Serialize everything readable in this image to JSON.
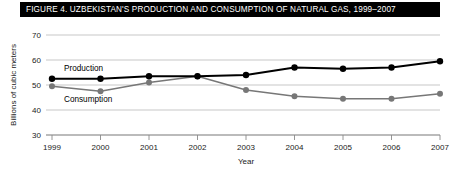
{
  "figure": {
    "title": "FIGURE 4. UZBEKISTAN'S PRODUCTION AND CONSUMPTION OF NATURAL GAS, 1999–2007"
  },
  "colors": {
    "title_bar_background": "#000000",
    "title_text": "#ffffff",
    "production_line": "#000000",
    "consumption_line": "#777777",
    "gridline": "#b9b9b9",
    "axis": "#8a8a8a",
    "page_background": "#ffffff"
  },
  "chart_data": {
    "type": "line",
    "title": "FIGURE 4. UZBEKISTAN'S PRODUCTION AND CONSUMPTION OF NATURAL GAS, 1999–2007",
    "xlabel": "Year",
    "ylabel": "Billions of cubic meters",
    "categories": [
      "1999",
      "2000",
      "2001",
      "2002",
      "2003",
      "2004",
      "2005",
      "2006",
      "2007"
    ],
    "x": [
      1999,
      2000,
      2001,
      2002,
      2003,
      2004,
      2005,
      2006,
      2007
    ],
    "ylim": [
      30,
      70
    ],
    "xlim": [
      1999,
      2007
    ],
    "yticks": [
      30,
      40,
      50,
      60,
      70
    ],
    "ytick_labels": [
      "30",
      "40",
      "50",
      "60",
      "70"
    ],
    "xticks": [
      1999,
      2000,
      2001,
      2002,
      2003,
      2004,
      2005,
      2006,
      2007
    ],
    "xtick_labels": [
      "1999",
      "2000",
      "2001",
      "2002",
      "2003",
      "2004",
      "2005",
      "2006",
      "2007"
    ],
    "grid": true,
    "grid_axis": "y",
    "legend": "inline-annotations",
    "series": [
      {
        "name": "Production",
        "color": "#000000",
        "marker": "circle",
        "values": [
          52.5,
          52.5,
          53.5,
          53.5,
          54.0,
          57.0,
          56.5,
          57.0,
          59.5
        ]
      },
      {
        "name": "Consumption",
        "color": "#777777",
        "marker": "circle",
        "values": [
          49.5,
          47.5,
          51.0,
          53.5,
          48.0,
          45.5,
          44.5,
          44.5,
          46.5
        ]
      }
    ],
    "annotations": [
      {
        "text": "Production",
        "series": "Production"
      },
      {
        "text": "Consumption",
        "series": "Consumption"
      }
    ]
  }
}
